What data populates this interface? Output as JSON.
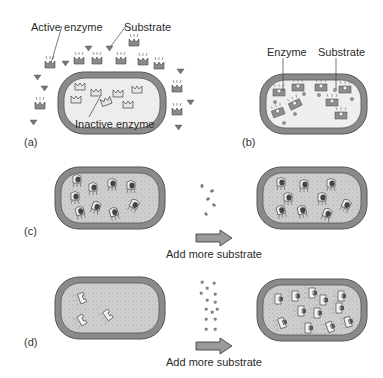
{
  "figure": {
    "panels": [
      {
        "id": "a",
        "letter": "(a)",
        "labels": {
          "active_enzyme": "Active enzyme",
          "substrate": "Substrate",
          "inactive_enzyme": "Inactive enzyme"
        }
      },
      {
        "id": "b",
        "letter": "(b)",
        "labels": {
          "enzyme": "Enzyme",
          "substrate": "Substrate"
        }
      },
      {
        "id": "c",
        "letter": "(c)",
        "arrow_label": "Add more substrate"
      },
      {
        "id": "d",
        "letter": "(d)",
        "arrow_label": "Add more substrate"
      }
    ]
  },
  "colors": {
    "cell_wall": "#7a7a7a",
    "cell_wall_inner": "#5a5a5a",
    "cell_fill_light": "#ececec",
    "cell_fill_dotted": "#c8c8c8",
    "enzyme_fill": "#8a8a8a",
    "arrow_fill": "#9a9a9a"
  }
}
